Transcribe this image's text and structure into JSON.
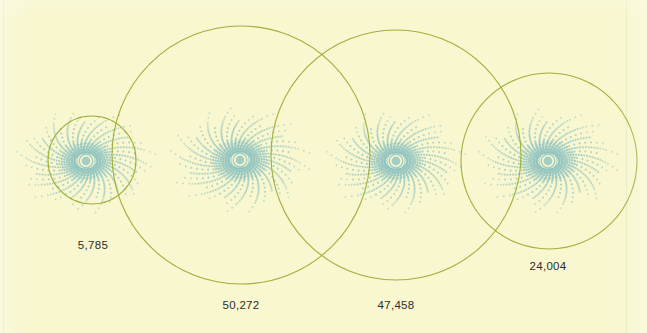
{
  "figure": {
    "title": "",
    "background_color": "#f8f7cf",
    "circle_stroke_color": "#9aad33",
    "dot_color": "#8fc3c0",
    "core_ring_color": "#8cc2c0",
    "label_color": "#2e2e28",
    "width": 647,
    "height": 333
  },
  "chart_data": {
    "type": "scatter",
    "title": "",
    "subtitle": "",
    "xlabel": "",
    "ylabel": "",
    "grid": false,
    "legend": null,
    "annotations": [
      "5,785",
      "50,272",
      "47,458",
      "24,004"
    ],
    "categories": [
      "5,785",
      "50,272",
      "47,458",
      "24,004"
    ],
    "values": [
      5785,
      50272,
      47458,
      24004
    ],
    "series": [
      {
        "name": "proportional circles",
        "values": [
          5785,
          50272,
          47458,
          24004
        ]
      }
    ],
    "marks": [
      {
        "label": "5,785",
        "value": 5785,
        "circle": {
          "cx": 92,
          "cy": 160,
          "r": 44
        },
        "burst": {
          "cx": 86,
          "cy": 161,
          "r": 76
        },
        "label_x": 93,
        "label_y": 239
      },
      {
        "label": "50,272",
        "value": 50272,
        "circle": {
          "cx": 241,
          "cy": 155,
          "r": 129
        },
        "burst": {
          "cx": 240,
          "cy": 160,
          "r": 78
        },
        "label_x": 241,
        "label_y": 299
      },
      {
        "label": "47,458",
        "value": 47458,
        "circle": {
          "cx": 396,
          "cy": 155,
          "r": 125
        },
        "burst": {
          "cx": 396,
          "cy": 161,
          "r": 76
        },
        "label_x": 396,
        "label_y": 299
      },
      {
        "label": "24,004",
        "value": 24004,
        "circle": {
          "cx": 549,
          "cy": 161,
          "r": 88
        },
        "burst": {
          "cx": 548,
          "cy": 161,
          "r": 77
        },
        "label_x": 548,
        "label_y": 260
      }
    ]
  },
  "labels": {
    "first": "5,785",
    "second": "50,272",
    "third": "47,458",
    "fourth": "24,004"
  }
}
